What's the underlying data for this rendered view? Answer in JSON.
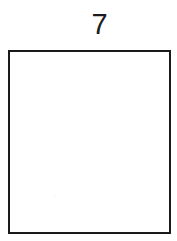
{
  "figure": {
    "label": "7",
    "label_position": "above",
    "shape": {
      "kind": "rectangle",
      "fill": "#ffffff",
      "stroke": "#1a1a1a",
      "stroke_width_px": 2,
      "x_px": 8,
      "y_px": 50,
      "width_px": 159,
      "height_px": 180,
      "contents": ""
    },
    "background": "#ffffff",
    "text_color": "#1c1c1c"
  }
}
